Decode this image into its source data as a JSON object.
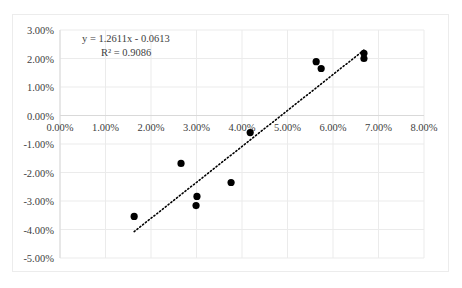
{
  "chart_data": {
    "type": "scatter",
    "title": "",
    "xlabel": "",
    "ylabel": "",
    "xlim": [
      0,
      0.08
    ],
    "ylim": [
      -0.05,
      0.03
    ],
    "grid": true,
    "legend": "none",
    "x_ticks": [
      "0.00%",
      "1.00%",
      "2.00%",
      "3.00%",
      "4.00%",
      "5.00%",
      "6.00%",
      "7.00%",
      "8.00%"
    ],
    "y_ticks": [
      "3.00%",
      "2.00%",
      "1.00%",
      "0.00%",
      "-1.00%",
      "-2.00%",
      "-3.00%",
      "-4.00%",
      "-5.00%"
    ],
    "series": [
      {
        "name": "Data",
        "marker": "circle",
        "color": "#000000",
        "points": [
          {
            "x": 0.0163,
            "y": -0.0354
          },
          {
            "x": 0.0266,
            "y": -0.0168
          },
          {
            "x": 0.0301,
            "y": -0.0284
          },
          {
            "x": 0.0299,
            "y": -0.0316
          },
          {
            "x": 0.0376,
            "y": -0.0235
          },
          {
            "x": 0.0418,
            "y": -0.006
          },
          {
            "x": 0.0563,
            "y": 0.0189
          },
          {
            "x": 0.0574,
            "y": 0.0165
          },
          {
            "x": 0.0668,
            "y": 0.0218
          },
          {
            "x": 0.0668,
            "y": 0.02
          }
        ]
      }
    ],
    "trendline": {
      "type": "linear",
      "style": "dotted",
      "color": "#000000",
      "slope": 1.2611,
      "intercept": -0.0613,
      "x_range": [
        0.0163,
        0.0668
      ],
      "equation_label": "y = 1.2611x - 0.0613",
      "r2_label": "R² = 0.9086"
    }
  }
}
